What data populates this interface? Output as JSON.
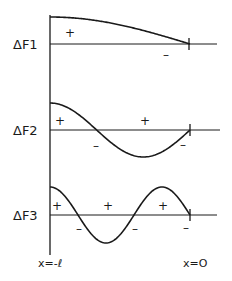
{
  "panels": [
    {
      "label": "ΔF1",
      "mode": 1,
      "signs": [
        {
          "text": "+",
          "x": 70,
          "y": 37
        },
        {
          "text": "–",
          "x": 166,
          "y": 59
        }
      ]
    },
    {
      "label": "ΔF2",
      "mode": 2,
      "signs": [
        {
          "text": "+",
          "x": 60,
          "y": 125
        },
        {
          "text": "–",
          "x": 96,
          "y": 150
        },
        {
          "text": "+",
          "x": 145,
          "y": 125
        },
        {
          "text": "–",
          "x": 183,
          "y": 149
        }
      ]
    },
    {
      "label": "ΔF3",
      "mode": 3,
      "signs": [
        {
          "text": "+",
          "x": 57,
          "y": 210
        },
        {
          "text": "–",
          "x": 79,
          "y": 233
        },
        {
          "text": "+",
          "x": 108,
          "y": 210
        },
        {
          "text": "–",
          "x": 135,
          "y": 233
        },
        {
          "text": "+",
          "x": 163,
          "y": 210
        },
        {
          "text": "–",
          "x": 186,
          "y": 232
        }
      ]
    }
  ],
  "axis_labels": {
    "left": "x=-ℓ",
    "right": "x=O"
  },
  "colors": {
    "stroke": "#1a1a1a",
    "background": "#ffffff"
  }
}
